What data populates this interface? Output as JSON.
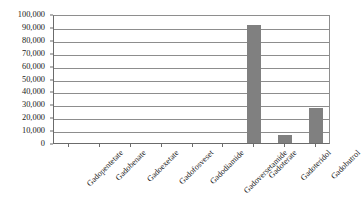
{
  "chart_data": {
    "type": "bar",
    "title": "",
    "subtitle": "",
    "xlabel": "",
    "ylabel": "",
    "ylim": [
      0,
      100000
    ],
    "yticks": [
      0,
      10000,
      20000,
      30000,
      40000,
      50000,
      60000,
      70000,
      80000,
      90000,
      100000
    ],
    "ytick_labels": [
      "0",
      "10,000",
      "20,000",
      "30,000",
      "40,000",
      "50,000",
      "60,000",
      "70,000",
      "80,000",
      "90,000",
      "100,000"
    ],
    "grid": true,
    "legend": false,
    "legend_position": "none",
    "bar_color": "#808080",
    "categories": [
      "Gadopentetate",
      "Gadobenate",
      "Gadoexetate",
      "Gadofosveset",
      "Gadodiamide",
      "Gadoversetamide",
      "Gadoterate",
      "Gadoteridol",
      "Gadobutrol"
    ],
    "values": [
      0,
      0,
      0,
      0,
      0,
      0,
      91500,
      6000,
      27000
    ],
    "annotations": []
  },
  "colors": {
    "background": "#ffffff",
    "bar": "#808080",
    "gridline": "#8d8d8d",
    "axis": "#6b6b6b",
    "text": "#1a1a1a"
  }
}
